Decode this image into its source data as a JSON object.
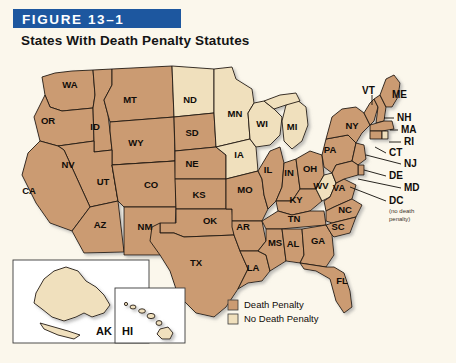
{
  "figure": {
    "banner_label": "FIGURE 13–1",
    "title": "States With Death Penalty Statutes",
    "banner_color": "#1d579f",
    "background_color": "#fbf7ec"
  },
  "legend": {
    "items": [
      {
        "label": "Death Penalty",
        "color": "#cb9b72"
      },
      {
        "label": "No Death Penalty",
        "color": "#f0e0bd"
      }
    ]
  },
  "map": {
    "death_penalty_color": "#cb9b72",
    "no_death_penalty_color": "#f0e0bd",
    "water_color": "#ffffff",
    "border_color": "#231a12",
    "states": [
      {
        "code": "WA",
        "status": "death",
        "lx": 70,
        "ly": 30
      },
      {
        "code": "OR",
        "status": "death",
        "lx": 48,
        "ly": 66
      },
      {
        "code": "ID",
        "status": "death",
        "lx": 95,
        "ly": 72
      },
      {
        "code": "MT",
        "status": "death",
        "lx": 130,
        "ly": 45
      },
      {
        "code": "WY",
        "status": "death",
        "lx": 136,
        "ly": 88
      },
      {
        "code": "NV",
        "status": "death",
        "lx": 68,
        "ly": 110
      },
      {
        "code": "UT",
        "status": "death",
        "lx": 103,
        "ly": 127
      },
      {
        "code": "CA",
        "status": "death",
        "lx": 29,
        "ly": 136
      },
      {
        "code": "AZ",
        "status": "death",
        "lx": 100,
        "ly": 170
      },
      {
        "code": "CO",
        "status": "death",
        "lx": 151,
        "ly": 130
      },
      {
        "code": "NM",
        "status": "death",
        "lx": 145,
        "ly": 172
      },
      {
        "code": "ND",
        "status": "none",
        "lx": 190,
        "ly": 45
      },
      {
        "code": "SD",
        "status": "death",
        "lx": 192,
        "ly": 78
      },
      {
        "code": "NE",
        "status": "death",
        "lx": 192,
        "ly": 109
      },
      {
        "code": "KS",
        "status": "death",
        "lx": 199,
        "ly": 140
      },
      {
        "code": "OK",
        "status": "death",
        "lx": 210,
        "ly": 166
      },
      {
        "code": "TX",
        "status": "death",
        "lx": 196,
        "ly": 208
      },
      {
        "code": "MN",
        "status": "none",
        "lx": 235,
        "ly": 59
      },
      {
        "code": "IA",
        "status": "none",
        "lx": 239,
        "ly": 100
      },
      {
        "code": "MO",
        "status": "death",
        "lx": 245,
        "ly": 135
      },
      {
        "code": "AR",
        "status": "death",
        "lx": 243,
        "ly": 172
      },
      {
        "code": "LA",
        "status": "death",
        "lx": 253,
        "ly": 213
      },
      {
        "code": "WI",
        "status": "none",
        "lx": 262,
        "ly": 69
      },
      {
        "code": "IL",
        "status": "death",
        "lx": 268,
        "ly": 115
      },
      {
        "code": "MS",
        "status": "death",
        "lx": 275,
        "ly": 188
      },
      {
        "code": "MI",
        "status": "none",
        "lx": 292,
        "ly": 72
      },
      {
        "code": "IN",
        "status": "death",
        "lx": 289,
        "ly": 118
      },
      {
        "code": "KY",
        "status": "death",
        "lx": 296,
        "ly": 145
      },
      {
        "code": "TN",
        "status": "death",
        "lx": 294,
        "ly": 164
      },
      {
        "code": "AL",
        "status": "death",
        "lx": 293,
        "ly": 189
      },
      {
        "code": "OH",
        "status": "death",
        "lx": 310,
        "ly": 114
      },
      {
        "code": "WV",
        "status": "none",
        "lx": 321,
        "ly": 131
      },
      {
        "code": "GA",
        "status": "death",
        "lx": 318,
        "ly": 186
      },
      {
        "code": "FL",
        "status": "death",
        "lx": 342,
        "ly": 226
      },
      {
        "code": "PA",
        "status": "death",
        "lx": 330,
        "ly": 95
      },
      {
        "code": "VA",
        "status": "death",
        "lx": 339,
        "ly": 133
      },
      {
        "code": "NC",
        "status": "death",
        "lx": 345,
        "ly": 155
      },
      {
        "code": "SC",
        "status": "death",
        "lx": 338,
        "ly": 172
      },
      {
        "code": "NY",
        "status": "death",
        "lx": 352,
        "ly": 71
      }
    ],
    "outer_labels": [
      {
        "code": "VT",
        "status": "death",
        "tx": 362,
        "ly": 36
      },
      {
        "code": "ME",
        "status": "death",
        "tx": 392,
        "ly": 40
      },
      {
        "code": "NH",
        "status": "death",
        "tx": 397,
        "ly": 63
      },
      {
        "code": "MA",
        "status": "death",
        "tx": 401,
        "ly": 75
      },
      {
        "code": "RI",
        "status": "none",
        "tx": 404,
        "ly": 87
      },
      {
        "code": "CT",
        "status": "death",
        "tx": 389,
        "ly": 98
      },
      {
        "code": "NJ",
        "status": "death",
        "tx": 404,
        "ly": 109
      },
      {
        "code": "DE",
        "status": "death",
        "tx": 389,
        "ly": 121
      },
      {
        "code": "MD",
        "status": "death",
        "tx": 404,
        "ly": 133
      },
      {
        "code": "DC",
        "status": "none",
        "tx": 389,
        "ly": 146
      }
    ],
    "dc_note_lines": [
      "(no death",
      "penalty)"
    ],
    "insets": [
      {
        "code": "AK",
        "status": "none"
      },
      {
        "code": "HI",
        "status": "none"
      }
    ]
  }
}
